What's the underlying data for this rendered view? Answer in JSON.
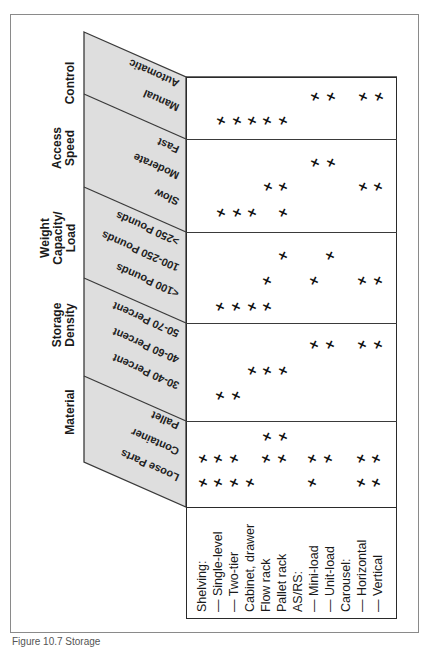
{
  "figure": {
    "caption_partial": "Figure 10.7  Storage"
  },
  "column_groups": [
    {
      "id": "control",
      "label": "Control",
      "label_lines": [
        "Control"
      ],
      "sub": [
        "Automatic",
        "Manual"
      ]
    },
    {
      "id": "access_speed",
      "label": "Access Speed",
      "label_lines": [
        "Access",
        "Speed"
      ],
      "sub": [
        "Fast",
        "Moderate",
        "Slow"
      ]
    },
    {
      "id": "weight",
      "label": "Weight Capacity/ Load",
      "label_lines": [
        "Weight",
        "Capacity/",
        "Load"
      ],
      "sub": [
        ">250 Pounds",
        "100-250 Pounds",
        "<100 Pounds"
      ]
    },
    {
      "id": "density",
      "label": "Storage Density",
      "label_lines": [
        "Storage",
        "Density"
      ],
      "sub": [
        "50-70 Percent",
        "40-60 Percent",
        "30-40 Percent"
      ]
    },
    {
      "id": "material",
      "label": "Material",
      "label_lines": [
        "Material"
      ],
      "sub": [
        "Pallet",
        "Container",
        "Loose Parts"
      ]
    }
  ],
  "row_labels": [
    "Shelving:",
    "— Single-level",
    "— Two-tier",
    "Cabinet, drawer",
    "Flow rack",
    "Pallet rack",
    "AS/RS:",
    "— Mini-load",
    "— Unit-load",
    "Carousel:",
    "— Horizontal",
    "— Vertical"
  ],
  "mark_symbol": "✕",
  "table": {
    "Automatic": [
      "Mini-load",
      "Unit-load",
      "Horizontal",
      "Vertical"
    ],
    "Manual": [
      "Single-level",
      "Two-tier",
      "Cabinet, drawer",
      "Flow rack",
      "Pallet rack"
    ],
    "Fast": [
      "Mini-load",
      "Unit-load"
    ],
    "Moderate": [
      "Flow rack",
      "Pallet rack",
      "Horizontal",
      "Vertical"
    ],
    "Slow": [
      "Single-level",
      "Two-tier",
      "Cabinet, drawer",
      "Pallet rack"
    ],
    ">250 Pounds": [
      "Pallet rack",
      "Unit-load"
    ],
    "100-250 Pounds": [
      "Flow rack",
      "Mini-load",
      "Horizontal",
      "Vertical"
    ],
    "<100 Pounds": [
      "Single-level",
      "Two-tier",
      "Cabinet, drawer",
      "Flow rack"
    ],
    "50-70 Percent": [
      "Mini-load",
      "Unit-load",
      "Horizontal",
      "Vertical"
    ],
    "40-60 Percent": [
      "Cabinet, drawer",
      "Flow rack",
      "Pallet rack"
    ],
    "30-40 Percent": [
      "Single-level",
      "Two-tier"
    ],
    "Pallet": [
      "Flow rack",
      "Pallet rack"
    ],
    "Container": [
      "Shelving",
      "Single-level",
      "Two-tier",
      "Flow rack",
      "Pallet rack",
      "Mini-load",
      "Unit-load",
      "Horizontal",
      "Vertical"
    ],
    "Loose Parts": [
      "Shelving",
      "Single-level",
      "Two-tier",
      "Cabinet, drawer",
      "Mini-load",
      "Horizontal",
      "Vertical"
    ]
  },
  "marks": [
    {
      "row": "Automatic",
      "y": 97,
      "xs": [
        315,
        331,
        363,
        379
      ]
    },
    {
      "row": "Manual",
      "y": 121,
      "xs": [
        221,
        237,
        252,
        267,
        283
      ]
    },
    {
      "row": "Fast",
      "y": 163,
      "xs": [
        315,
        331
      ]
    },
    {
      "row": "Moderate",
      "y": 187,
      "xs": [
        268,
        283,
        363,
        378
      ]
    },
    {
      "row": "Slow",
      "y": 213,
      "xs": [
        221,
        237,
        252,
        283
      ]
    },
    {
      "row": ">250 Pounds",
      "y": 256,
      "xs": [
        283,
        330
      ]
    },
    {
      "row": "100-250 Pounds",
      "y": 281,
      "xs": [
        267,
        314,
        362,
        378
      ]
    },
    {
      "row": "<100 Pounds",
      "y": 307,
      "xs": [
        220,
        236,
        252,
        267
      ]
    },
    {
      "row": "50-70 Percent",
      "y": 345,
      "xs": [
        314,
        330,
        362,
        378
      ]
    },
    {
      "row": "40-60 Percent",
      "y": 371,
      "xs": [
        252,
        267,
        283
      ]
    },
    {
      "row": "30-40 Percent",
      "y": 396,
      "xs": [
        220,
        236
      ]
    },
    {
      "row": "Pallet",
      "y": 437,
      "xs": [
        267,
        283
      ]
    },
    {
      "row": "Container",
      "y": 459,
      "xs": [
        203,
        218,
        234,
        266,
        282,
        312,
        328,
        361,
        376
      ]
    },
    {
      "row": "Loose Parts",
      "y": 483,
      "xs": [
        203,
        218,
        234,
        250,
        312,
        361,
        376
      ]
    }
  ]
}
